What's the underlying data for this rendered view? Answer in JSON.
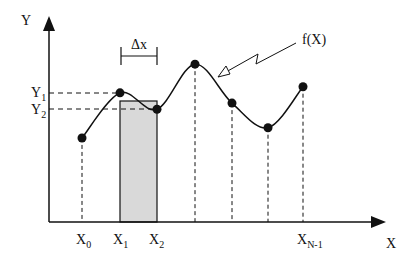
{
  "diagram": {
    "axes": {
      "y_label": "Y",
      "x_label": "X"
    },
    "curve_label": "f(X)",
    "interval_label": "Δx",
    "y_ticks": [
      {
        "base": "Y",
        "sub": "1"
      },
      {
        "base": "Y",
        "sub": "2"
      }
    ],
    "x_ticks": [
      {
        "base": "X",
        "sub": "0"
      },
      {
        "base": "X",
        "sub": "1"
      },
      {
        "base": "X",
        "sub": "2"
      },
      {
        "base": "X",
        "sub": "N-1"
      }
    ],
    "sample_points": [
      {
        "name": "x0",
        "rel_y": 0.41
      },
      {
        "name": "x1",
        "rel_y": 0.63
      },
      {
        "name": "x2",
        "rel_y": 0.55
      },
      {
        "name": "x3",
        "rel_y": 0.77
      },
      {
        "name": "x4",
        "rel_y": 0.58
      },
      {
        "name": "x5",
        "rel_y": 0.46
      },
      {
        "name": "x6",
        "rel_y": 0.66
      }
    ],
    "shaded_rectangle": {
      "from": "X1",
      "to": "X2",
      "fill": "#d9d9d9"
    },
    "colors": {
      "ink": "#111111",
      "shade": "#d9d9d9",
      "background": "#ffffff"
    }
  }
}
